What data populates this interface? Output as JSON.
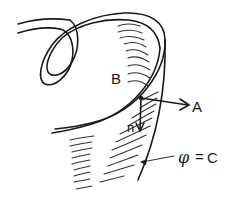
{
  "diagram": {
    "labels": {
      "surface_label": "B",
      "tangent_vector_label": "A",
      "normal_vector_label": "n",
      "level_set_symbol": "φ",
      "level_set_equals": "=",
      "level_set_constant": "C"
    },
    "colors": {
      "line": "#1a1a1a",
      "background": "#ffffff"
    }
  }
}
